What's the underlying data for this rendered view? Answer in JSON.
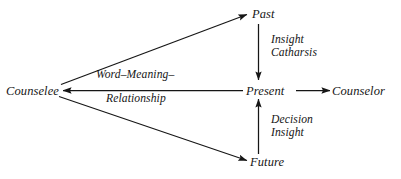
{
  "diagram": {
    "background_color": "#ffffff",
    "stroke_color": "#161616",
    "text_color": "#161616",
    "nodes": [
      {
        "id": "counselee",
        "label": "Counselee"
      },
      {
        "id": "past",
        "label": "Past"
      },
      {
        "id": "present",
        "label": "Present"
      },
      {
        "id": "counselor",
        "label": "Counselor"
      },
      {
        "id": "future",
        "label": "Future"
      }
    ],
    "edge_labels": {
      "past_to_present": {
        "line1": "Insight",
        "line2": "Catharsis"
      },
      "future_to_present": {
        "line1": "Decision",
        "line2": "Insight"
      },
      "present_to_counselee": {
        "line1": "Word–Meaning–",
        "line2": "Relationship"
      }
    },
    "edges": [
      {
        "from": "counselee",
        "to": "past",
        "arrow": "to",
        "style": "diagonal"
      },
      {
        "from": "counselee",
        "to": "future",
        "arrow": "to",
        "style": "diagonal"
      },
      {
        "from": "past",
        "to": "present",
        "arrow": "to",
        "style": "vertical-down"
      },
      {
        "from": "future",
        "to": "present",
        "arrow": "to",
        "style": "vertical-up"
      },
      {
        "from": "present",
        "to": "counselee",
        "arrow": "to",
        "style": "horizontal-left"
      },
      {
        "from": "present",
        "to": "counselor",
        "arrow": "to",
        "style": "horizontal-right"
      }
    ]
  }
}
